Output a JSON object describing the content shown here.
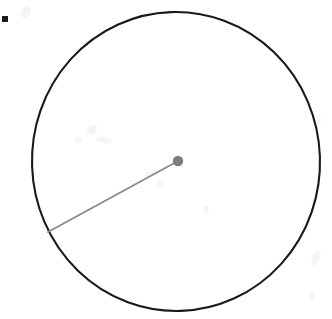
{
  "document": {
    "kind": "scanned-geometry-figure",
    "description": "Hand-drawn circle with a single radius segment drawn from the centre point to the lower-left of the circumference",
    "background_color": "#ffffff",
    "width": 332,
    "height": 319,
    "labels": [],
    "text_content": ""
  },
  "figure": {
    "circle": {
      "name": "circle-outline",
      "center_x": 176,
      "center_y": 161.5,
      "radius_x": 144,
      "radius_y": 149.5,
      "stroke_color": "#1a1a1a",
      "stroke_width": 2.1,
      "fill": "none",
      "rotation_deg": -2
    },
    "center_point": {
      "name": "circle-center-dot",
      "x": 178,
      "y": 161,
      "radius": 5.2,
      "color": "#7d7d7d"
    },
    "radius_line": {
      "name": "radius-segment",
      "x1": 178,
      "y1": 161,
      "x2": 48,
      "y2": 232,
      "stroke_color": "#8a8a8a",
      "stroke_width": 1.8,
      "length_px": 148,
      "angle_deg": 208.6
    },
    "corner_marker": {
      "name": "corner-square-marker",
      "x": 2,
      "y": 16,
      "width": 6,
      "height": 6,
      "color": "#1c1c1c"
    }
  },
  "artifacts": {
    "name": "scan-smudges",
    "color": "#e9e9e9",
    "marks": [
      {
        "x": 26,
        "y": 12,
        "w": 9,
        "h": 13,
        "rot": 28,
        "opacity": 0.55
      },
      {
        "x": 92,
        "y": 130,
        "w": 11,
        "h": 8,
        "rot": -32,
        "opacity": 0.5
      },
      {
        "x": 104,
        "y": 140,
        "w": 16,
        "h": 6,
        "rot": 8,
        "opacity": 0.45
      },
      {
        "x": 78,
        "y": 140,
        "w": 7,
        "h": 7,
        "rot": 40,
        "opacity": 0.4
      },
      {
        "x": 150,
        "y": 174,
        "w": 13,
        "h": 7,
        "rot": -20,
        "opacity": 0.4
      },
      {
        "x": 160,
        "y": 184,
        "w": 8,
        "h": 9,
        "rot": 15,
        "opacity": 0.35
      },
      {
        "x": 206,
        "y": 209,
        "w": 5,
        "h": 7,
        "rot": 0,
        "opacity": 0.5
      },
      {
        "x": 316,
        "y": 258,
        "w": 8,
        "h": 16,
        "rot": 22,
        "opacity": 0.45
      },
      {
        "x": 312,
        "y": 296,
        "w": 4,
        "h": 11,
        "rot": 0,
        "opacity": 0.4
      },
      {
        "x": 318,
        "y": 122,
        "w": 6,
        "h": 10,
        "rot": 18,
        "opacity": 0.3
      }
    ]
  }
}
